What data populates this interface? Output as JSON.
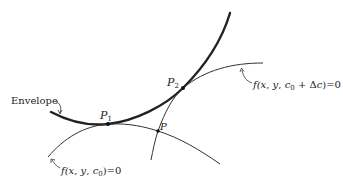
{
  "diagram": {
    "colors": {
      "ink": "#222222",
      "background": "#ffffff"
    },
    "labels": {
      "envelope": "Envelope",
      "p1": "P",
      "p1_sub": "1",
      "p2": "P",
      "p2_sub": "2",
      "p": "P",
      "curve_c0": {
        "prefix": "f(",
        "x": "x",
        "comma1": ", ",
        "y": "y",
        "comma2": ", ",
        "c": "c",
        "c_sub": "0",
        "suffix": ")=0"
      },
      "curve_c0_dc": {
        "prefix": "f(",
        "x": "x",
        "comma1": ", ",
        "y": "y",
        "comma2": ", ",
        "c": "c",
        "c_sub": "0",
        "plus": " + Δ",
        "dc": "c",
        "suffix": ")=0"
      }
    },
    "points": [
      {
        "name": "P1",
        "x": 108,
        "y": 124
      },
      {
        "name": "P2",
        "x": 183,
        "y": 88
      },
      {
        "name": "P",
        "x": 158,
        "y": 131
      }
    ]
  }
}
